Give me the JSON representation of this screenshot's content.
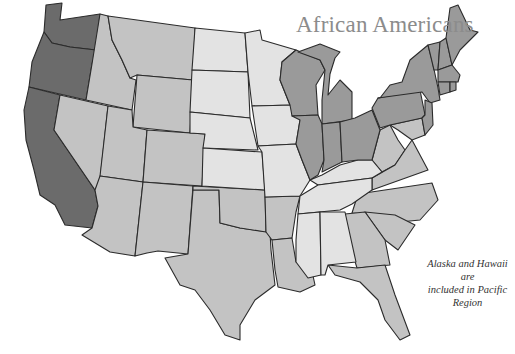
{
  "title": "African Americans",
  "note": {
    "line1": "Alaska and Hawaii are",
    "line2": "included in Pacific Region"
  },
  "shades": {
    "level4": "#6b6b6b",
    "level3": "#9a9a9a",
    "level2": "#c3c3c3",
    "level1": "#e3e3e3"
  },
  "regions": [
    {
      "name": "Pacific",
      "shade": "level4",
      "states": [
        "WA",
        "OR",
        "CA"
      ]
    },
    {
      "name": "East North Central / Mid-Atlantic / New England",
      "shade": "level3",
      "states": [
        "WI",
        "MI",
        "IL",
        "IN",
        "OH",
        "PA",
        "NY",
        "NJ",
        "VT",
        "NH",
        "ME",
        "MA",
        "CT",
        "RI"
      ]
    },
    {
      "name": "Mountain / West South Central / South Atlantic",
      "shade": "level2",
      "states": [
        "ID",
        "MT",
        "WY",
        "NV",
        "UT",
        "CO",
        "AZ",
        "NM",
        "TX",
        "OK",
        "AR",
        "LA",
        "WV",
        "VA",
        "NC",
        "SC",
        "GA",
        "FL",
        "MD",
        "DE"
      ]
    },
    {
      "name": "West North Central / East South Central",
      "shade": "level1",
      "states": [
        "ND",
        "SD",
        "NE",
        "KS",
        "MN",
        "IA",
        "MO",
        "KY",
        "TN",
        "MS",
        "AL"
      ]
    }
  ]
}
